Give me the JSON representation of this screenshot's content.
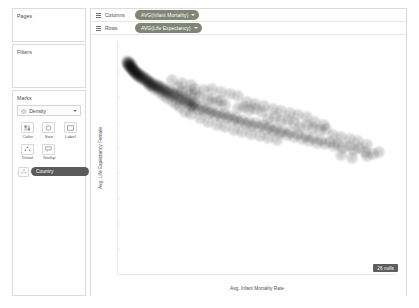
{
  "shelves": {
    "pages": {
      "title": "Pages"
    },
    "filters": {
      "title": "Filters"
    },
    "marks": {
      "title": "Marks",
      "mark_type": "Density",
      "mark_type_icon": "density-icon",
      "buttons": [
        {
          "label": "Color",
          "icon": "color-icon"
        },
        {
          "label": "Size",
          "icon": "size-icon"
        },
        {
          "label": "Label",
          "icon": "label-icon"
        },
        {
          "label": "Detail",
          "icon": "detail-icon"
        },
        {
          "label": "Tooltip",
          "icon": "tooltip-icon"
        }
      ],
      "encoding_pills": [
        {
          "shelf": "Detail",
          "field": "Country",
          "icon": "detail-icon"
        }
      ]
    }
  },
  "sheet": {
    "columns": {
      "label": "Columns",
      "pill": "AVG(Infant Mortality)"
    },
    "rows": {
      "label": "Rows",
      "pill": "AVG(Life Expectancy)"
    },
    "nulls_badge": "26 nulls"
  },
  "colors": {
    "field_pill": "#808575",
    "encoding_pill": "#5b5b5b",
    "mark_color": "#000000",
    "axis": "#eaeaea",
    "badge": "#5d5d5d"
  },
  "chart_data": {
    "type": "scatter",
    "title": "",
    "xlabel": "Avg. Infant Mortality Rate",
    "ylabel": "Avg. Life Expectancy Female",
    "xlim": [
      0.0,
      0.13
    ],
    "ylim": [
      0,
      92
    ],
    "xticks": [
      0.0,
      0.02,
      0.04,
      0.06,
      0.08,
      0.1,
      0.12
    ],
    "xticklabels": [
      "0.00",
      "0.02",
      "0.04",
      "0.06",
      "0.08",
      "0.10",
      "0.12"
    ],
    "yticks": [
      0,
      10,
      20,
      30,
      40,
      50,
      60,
      70,
      80,
      90
    ],
    "yticklabels": [
      "0",
      "10",
      "20",
      "30",
      "40",
      "50",
      "60",
      "70",
      "80",
      "90"
    ],
    "grid": false,
    "legend": "none",
    "mark_type": "density",
    "detail": "Country",
    "points": [
      [
        0.004,
        83.2
      ],
      [
        0.0042,
        84.1
      ],
      [
        0.0045,
        83.0
      ],
      [
        0.0047,
        82.6
      ],
      [
        0.0049,
        83.6
      ],
      [
        0.0051,
        82.2
      ],
      [
        0.0053,
        83.4
      ],
      [
        0.0055,
        82.0
      ],
      [
        0.0057,
        81.4
      ],
      [
        0.0059,
        82.8
      ],
      [
        0.0061,
        81.0
      ],
      [
        0.0063,
        82.3
      ],
      [
        0.0065,
        80.8
      ],
      [
        0.0067,
        81.6
      ],
      [
        0.0069,
        80.2
      ],
      [
        0.0071,
        81.1
      ],
      [
        0.0073,
        79.8
      ],
      [
        0.0075,
        80.6
      ],
      [
        0.0077,
        79.4
      ],
      [
        0.0079,
        80.1
      ],
      [
        0.0082,
        79.0
      ],
      [
        0.0085,
        79.7
      ],
      [
        0.0088,
        78.6
      ],
      [
        0.0091,
        79.3
      ],
      [
        0.0094,
        78.2
      ],
      [
        0.0097,
        78.9
      ],
      [
        0.01,
        77.8
      ],
      [
        0.0103,
        78.4
      ],
      [
        0.0106,
        77.4
      ],
      [
        0.011,
        78.0
      ],
      [
        0.0114,
        77.0
      ],
      [
        0.0118,
        77.6
      ],
      [
        0.0122,
        76.5
      ],
      [
        0.0126,
        77.2
      ],
      [
        0.013,
        76.1
      ],
      [
        0.0134,
        76.8
      ],
      [
        0.0138,
        75.7
      ],
      [
        0.0142,
        76.4
      ],
      [
        0.0146,
        75.2
      ],
      [
        0.015,
        76.0
      ],
      [
        0.0155,
        74.8
      ],
      [
        0.016,
        75.6
      ],
      [
        0.0165,
        74.3
      ],
      [
        0.017,
        75.1
      ],
      [
        0.0175,
        73.9
      ],
      [
        0.018,
        74.7
      ],
      [
        0.0186,
        73.4
      ],
      [
        0.0192,
        74.2
      ],
      [
        0.0198,
        73.0
      ],
      [
        0.0204,
        73.8
      ],
      [
        0.021,
        72.4
      ],
      [
        0.0216,
        73.2
      ],
      [
        0.0222,
        71.9
      ],
      [
        0.0228,
        72.7
      ],
      [
        0.0235,
        71.3
      ],
      [
        0.0242,
        72.1
      ],
      [
        0.0249,
        70.7
      ],
      [
        0.0256,
        71.5
      ],
      [
        0.0263,
        70.1
      ],
      [
        0.027,
        70.9
      ],
      [
        0.0278,
        69.4
      ],
      [
        0.0286,
        70.2
      ],
      [
        0.0294,
        68.8
      ],
      [
        0.0302,
        69.6
      ],
      [
        0.031,
        68.1
      ],
      [
        0.0318,
        68.9
      ],
      [
        0.0327,
        67.4
      ],
      [
        0.0336,
        68.2
      ],
      [
        0.0345,
        66.7
      ],
      [
        0.0354,
        67.5
      ],
      [
        0.03,
        71.8
      ],
      [
        0.032,
        72.4
      ],
      [
        0.034,
        70.6
      ],
      [
        0.036,
        71.2
      ],
      [
        0.038,
        69.8
      ],
      [
        0.034,
        66.2
      ],
      [
        0.0352,
        65.5
      ],
      [
        0.0365,
        66.8
      ],
      [
        0.0378,
        64.9
      ],
      [
        0.039,
        65.8
      ],
      [
        0.0402,
        64.2
      ],
      [
        0.0415,
        65.0
      ],
      [
        0.0428,
        63.5
      ],
      [
        0.044,
        64.4
      ],
      [
        0.0452,
        62.8
      ],
      [
        0.0466,
        63.7
      ],
      [
        0.048,
        62.1
      ],
      [
        0.0494,
        63.0
      ],
      [
        0.0508,
        61.4
      ],
      [
        0.0522,
        62.3
      ],
      [
        0.042,
        68.6
      ],
      [
        0.044,
        69.2
      ],
      [
        0.046,
        67.8
      ],
      [
        0.048,
        68.4
      ],
      [
        0.05,
        66.9
      ],
      [
        0.0536,
        60.7
      ],
      [
        0.055,
        61.6
      ],
      [
        0.0565,
        60.0
      ],
      [
        0.058,
        60.9
      ],
      [
        0.0595,
        59.3
      ],
      [
        0.061,
        60.2
      ],
      [
        0.0626,
        58.6
      ],
      [
        0.0642,
        59.5
      ],
      [
        0.0658,
        57.9
      ],
      [
        0.0674,
        58.8
      ],
      [
        0.069,
        57.2
      ],
      [
        0.0706,
        58.1
      ],
      [
        0.0722,
        56.4
      ],
      [
        0.0738,
        57.4
      ],
      [
        0.0754,
        55.7
      ],
      [
        0.056,
        65.4
      ],
      [
        0.0585,
        66.1
      ],
      [
        0.061,
        64.6
      ],
      [
        0.064,
        65.2
      ],
      [
        0.067,
        63.8
      ],
      [
        0.077,
        56.6
      ],
      [
        0.0786,
        54.9
      ],
      [
        0.0802,
        55.9
      ],
      [
        0.082,
        54.2
      ],
      [
        0.0838,
        55.1
      ],
      [
        0.0856,
        53.4
      ],
      [
        0.0874,
        54.4
      ],
      [
        0.0892,
        52.7
      ],
      [
        0.091,
        53.6
      ],
      [
        0.0928,
        51.9
      ],
      [
        0.07,
        61.2
      ],
      [
        0.073,
        62.0
      ],
      [
        0.076,
        60.4
      ],
      [
        0.079,
        61.0
      ],
      [
        0.082,
        59.6
      ],
      [
        0.0946,
        52.9
      ],
      [
        0.0966,
        51.2
      ],
      [
        0.0986,
        52.1
      ],
      [
        0.1006,
        50.4
      ],
      [
        0.1026,
        51.4
      ],
      [
        0.085,
        58.2
      ],
      [
        0.088,
        58.9
      ],
      [
        0.091,
        57.5
      ],
      [
        0.094,
        56.8
      ],
      [
        0.097,
        57.2
      ],
      [
        0.105,
        49.6
      ],
      [
        0.1075,
        50.6
      ],
      [
        0.11,
        48.8
      ],
      [
        0.1125,
        49.8
      ],
      [
        0.115,
        48.0
      ],
      [
        0.1,
        55.0
      ],
      [
        0.104,
        54.0
      ],
      [
        0.108,
        53.2
      ],
      [
        0.112,
        52.4
      ],
      [
        0.116,
        51.0
      ],
      [
        0.048,
        72.0
      ],
      [
        0.052,
        71.0
      ],
      [
        0.056,
        70.2
      ],
      [
        0.03,
        75.4
      ],
      [
        0.034,
        74.6
      ],
      [
        0.025,
        76.6
      ],
      [
        0.028,
        74.0
      ],
      [
        0.036,
        73.2
      ],
      [
        0.04,
        72.6
      ],
      [
        0.044,
        73.0
      ],
      [
        0.06,
        68.0
      ],
      [
        0.064,
        67.0
      ],
      [
        0.068,
        66.2
      ],
      [
        0.072,
        65.0
      ],
      [
        0.076,
        64.2
      ],
      [
        0.08,
        63.4
      ],
      [
        0.084,
        62.6
      ],
      [
        0.088,
        61.8
      ],
      [
        0.092,
        60.0
      ],
      [
        0.096,
        59.0
      ],
      [
        0.038,
        61.5
      ],
      [
        0.042,
        60.0
      ],
      [
        0.046,
        59.0
      ],
      [
        0.05,
        58.2
      ],
      [
        0.054,
        57.0
      ],
      [
        0.058,
        56.2
      ],
      [
        0.062,
        55.4
      ],
      [
        0.066,
        54.6
      ],
      [
        0.07,
        53.8
      ],
      [
        0.074,
        53.0
      ],
      [
        0.034,
        63.0
      ],
      [
        0.031,
        64.0
      ],
      [
        0.029,
        66.0
      ],
      [
        0.027,
        67.2
      ],
      [
        0.025,
        68.4
      ],
      [
        0.023,
        69.6
      ],
      [
        0.021,
        70.8
      ],
      [
        0.019,
        72.0
      ],
      [
        0.017,
        73.2
      ],
      [
        0.015,
        74.4
      ],
      [
        0.119,
        47.2
      ],
      [
        0.1215,
        48.2
      ],
      [
        0.116,
        46.4
      ],
      [
        0.104,
        47.0
      ],
      [
        0.109,
        46.0
      ]
    ]
  }
}
